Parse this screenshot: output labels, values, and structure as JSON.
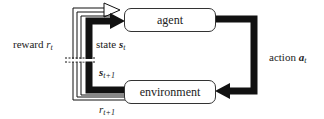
{
  "diagram": {
    "type": "reinforcement-learning-loop",
    "nodes": {
      "agent": "agent",
      "environment": "environment"
    },
    "labels": {
      "reward": {
        "text": "reward ",
        "var": "r",
        "sub": "t"
      },
      "state": {
        "text": "state ",
        "var": "s",
        "sub": "t"
      },
      "next_state": {
        "text": "",
        "var": "s",
        "sub": "t+1"
      },
      "next_reward": {
        "text": "",
        "var": "r",
        "sub": "t+1"
      },
      "action": {
        "text": "action ",
        "var": "a",
        "sub": "t"
      }
    },
    "colors": {
      "stroke": "#111111",
      "box_border": "#333333",
      "background": "#ffffff"
    }
  }
}
